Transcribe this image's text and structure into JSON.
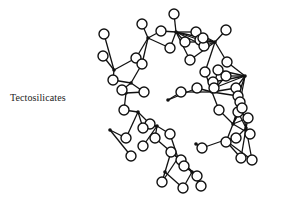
{
  "label": "Tectosilicates",
  "diagram": {
    "type": "molecular-structure",
    "colors": {
      "line": "#111111",
      "background": "#ffffff",
      "atom_fill": "#ffffff"
    },
    "si_atoms": [
      [
        148,
        38
      ],
      [
        176,
        32
      ],
      [
        215,
        42
      ],
      [
        114,
        70
      ],
      [
        131,
        83
      ],
      [
        168,
        100
      ],
      [
        212,
        92
      ],
      [
        245,
        76
      ],
      [
        110,
        130
      ],
      [
        126,
        93
      ],
      [
        138,
        112
      ],
      [
        157,
        126
      ],
      [
        178,
        158
      ],
      [
        196,
        144
      ],
      [
        233,
        124
      ],
      [
        246,
        128
      ],
      [
        225,
        140
      ],
      [
        165,
        172
      ],
      [
        192,
        172
      ]
    ],
    "o_atoms": [
      [
        142,
        24
      ],
      [
        174,
        14
      ],
      [
        226,
        30
      ],
      [
        104,
        34
      ],
      [
        161,
        31
      ],
      [
        185,
        42
      ],
      [
        196,
        32
      ],
      [
        200,
        40
      ],
      [
        204,
        46
      ],
      [
        203,
        38
      ],
      [
        103,
        56
      ],
      [
        136,
        58
      ],
      [
        142,
        64
      ],
      [
        170,
        48
      ],
      [
        190,
        60
      ],
      [
        205,
        72
      ],
      [
        218,
        70
      ],
      [
        226,
        76
      ],
      [
        227,
        62
      ],
      [
        113,
        80
      ],
      [
        122,
        90
      ],
      [
        144,
        92
      ],
      [
        181,
        92
      ],
      [
        197,
        88
      ],
      [
        213,
        82
      ],
      [
        214,
        88
      ],
      [
        236,
        88
      ],
      [
        238,
        96
      ],
      [
        240,
        102
      ],
      [
        124,
        110
      ],
      [
        150,
        124
      ],
      [
        143,
        128
      ],
      [
        155,
        138
      ],
      [
        170,
        134
      ],
      [
        171,
        152
      ],
      [
        181,
        160
      ],
      [
        184,
        166
      ],
      [
        202,
        148
      ],
      [
        219,
        110
      ],
      [
        226,
        142
      ],
      [
        238,
        112
      ],
      [
        242,
        108
      ],
      [
        248,
        118
      ],
      [
        250,
        134
      ],
      [
        236,
        138
      ],
      [
        126,
        138
      ],
      [
        143,
        146
      ],
      [
        131,
        156
      ],
      [
        162,
        182
      ],
      [
        183,
        188
      ],
      [
        201,
        186
      ],
      [
        197,
        176
      ],
      [
        241,
        158
      ],
      [
        252,
        160
      ]
    ]
  }
}
